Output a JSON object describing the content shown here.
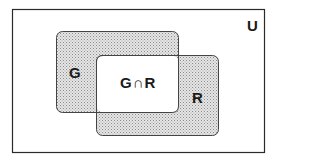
{
  "diagram": {
    "type": "venn",
    "universe_label": "U",
    "sets": [
      {
        "name": "G",
        "label": "G"
      },
      {
        "name": "R",
        "label": "R"
      }
    ],
    "intersection_label": "G∩R",
    "colors": {
      "border": "#2a2a2a",
      "shade": "#d8d8d8",
      "background": "#ffffff"
    }
  }
}
